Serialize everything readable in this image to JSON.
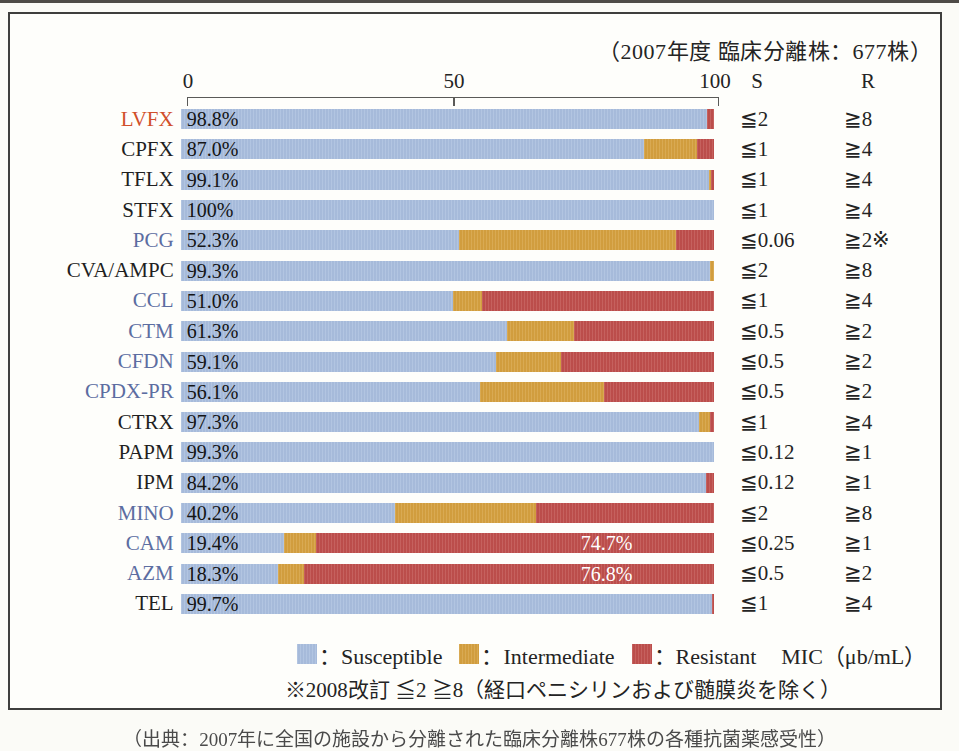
{
  "page": {
    "top_strip_color": "#4e4b47"
  },
  "chart": {
    "title": "（2007年度 臨床分離株：677株）",
    "axis": {
      "ticks": [
        "0",
        "50",
        "100"
      ],
      "col_s_header": "S",
      "col_r_header": "R"
    },
    "rows": [
      {
        "name": "LVFX",
        "name_color": "red",
        "pct_label": "98.8%",
        "s": 98.8,
        "i": 0,
        "r": 1.2,
        "s_mic": "≦2",
        "r_mic": "≧8"
      },
      {
        "name": "CPFX",
        "name_color": "black",
        "pct_label": "87.0%",
        "s": 87.0,
        "i": 9.8,
        "r": 3.2,
        "s_mic": "≦1",
        "r_mic": "≧4"
      },
      {
        "name": "TFLX",
        "name_color": "black",
        "pct_label": "99.1%",
        "s": 99.1,
        "i": 0.4,
        "r": 0.5,
        "s_mic": "≦1",
        "r_mic": "≧4"
      },
      {
        "name": "STFX",
        "name_color": "black",
        "pct_label": "100%",
        "s": 100,
        "i": 0,
        "r": 0,
        "s_mic": "≦1",
        "r_mic": "≧4"
      },
      {
        "name": "PCG",
        "name_color": "blue",
        "pct_label": "52.3%",
        "s": 52.3,
        "i": 40.7,
        "r": 7.0,
        "s_mic": "≦0.06",
        "r_mic": "≧2※"
      },
      {
        "name": "CVA/AMPC",
        "name_color": "black",
        "pct_label": "99.3%",
        "s": 99.3,
        "i": 0.7,
        "r": 0,
        "s_mic": "≦2",
        "r_mic": "≧8"
      },
      {
        "name": "CCL",
        "name_color": "blue",
        "pct_label": "51.0%",
        "s": 51.0,
        "i": 5.5,
        "r": 43.5,
        "s_mic": "≦1",
        "r_mic": "≧4"
      },
      {
        "name": "CTM",
        "name_color": "blue",
        "pct_label": "61.3%",
        "s": 61.3,
        "i": 12.4,
        "r": 26.3,
        "s_mic": "≦0.5",
        "r_mic": "≧2"
      },
      {
        "name": "CFDN",
        "name_color": "blue",
        "pct_label": "59.1%",
        "s": 59.1,
        "i": 12.2,
        "r": 28.7,
        "s_mic": "≦0.5",
        "r_mic": "≧2"
      },
      {
        "name": "CPDX-PR",
        "name_color": "blue",
        "pct_label": "56.1%",
        "s": 56.1,
        "i": 23.3,
        "r": 20.6,
        "s_mic": "≦0.5",
        "r_mic": "≧2"
      },
      {
        "name": "CTRX",
        "name_color": "black",
        "pct_label": "97.3%",
        "s": 97.3,
        "i": 2.0,
        "r": 0.7,
        "s_mic": "≦1",
        "r_mic": "≧4"
      },
      {
        "name": "PAPM",
        "name_color": "black",
        "pct_label": "99.3%",
        "s": 100,
        "i": 0,
        "r": 0,
        "s_mic": "≦0.12",
        "r_mic": "≧1"
      },
      {
        "name": "IPM",
        "name_color": "black",
        "pct_label": "84.2%",
        "s": 98.5,
        "i": 0,
        "r": 1.5,
        "s_mic": "≦0.12",
        "r_mic": "≧1"
      },
      {
        "name": "MINO",
        "name_color": "blue",
        "pct_label": "40.2%",
        "s": 40.2,
        "i": 26.4,
        "r": 33.4,
        "s_mic": "≦2",
        "r_mic": "≧8"
      },
      {
        "name": "CAM",
        "name_color": "blue",
        "pct_label": "19.4%",
        "s": 19.4,
        "i": 5.9,
        "r": 74.7,
        "inner_label": "74.7%",
        "s_mic": "≦0.25",
        "r_mic": "≧1"
      },
      {
        "name": "AZM",
        "name_color": "blue",
        "pct_label": "18.3%",
        "s": 18.3,
        "i": 4.9,
        "r": 76.8,
        "inner_label": "76.8%",
        "s_mic": "≦0.5",
        "r_mic": "≧2"
      },
      {
        "name": "TEL",
        "name_color": "black",
        "pct_label": "99.7%",
        "s": 99.7,
        "i": 0,
        "r": 0.3,
        "s_mic": "≦1",
        "r_mic": "≧4"
      }
    ],
    "legend": [
      {
        "label": "：Susceptible",
        "color": "#a9bede"
      },
      {
        "label": "：Intermediate",
        "color": "#d5a03f"
      },
      {
        "label": "：Resistant",
        "color": "#bf4f4c"
      }
    ],
    "mic_unit_label": "MIC（μb/mL）",
    "footnote": "※2008改訂 ≦2 ≧8（経口ペニシリンおよび髄膜炎を除く）"
  },
  "partial_caption": "（出典：2007年に全国の施設から分離された臨床分離株677株の各種抗菌薬感受性）",
  "colors": {
    "susceptible": "#a9bede",
    "intermediate": "#d5a03f",
    "resistant": "#bf4f4c",
    "label_blue": "#5c6da1",
    "label_red": "#d14f2a"
  },
  "chart_data": {
    "type": "bar",
    "orientation": "horizontal-stacked",
    "title": "（2007年度 臨床分離株：677株）",
    "x_range": [
      0,
      100
    ],
    "x_ticks": [
      0,
      50,
      100
    ],
    "categories": [
      "LVFX",
      "CPFX",
      "TFLX",
      "STFX",
      "PCG",
      "CVA/AMPC",
      "CCL",
      "CTM",
      "CFDN",
      "CPDX-PR",
      "CTRX",
      "PAPM",
      "IPM",
      "MINO",
      "CAM",
      "AZM",
      "TEL"
    ],
    "series": [
      {
        "name": "Susceptible",
        "values": [
          98.8,
          87.0,
          99.1,
          100,
          52.3,
          99.3,
          51.0,
          61.3,
          59.1,
          56.1,
          97.3,
          99.3,
          84.2,
          40.2,
          19.4,
          18.3,
          99.7
        ]
      },
      {
        "name": "Intermediate",
        "values": [
          0,
          9.8,
          0.4,
          0,
          40.7,
          0.7,
          5.5,
          12.4,
          12.2,
          23.3,
          2.0,
          0,
          0,
          26.4,
          5.9,
          4.9,
          0
        ]
      },
      {
        "name": "Resistant",
        "values": [
          1.2,
          3.2,
          0.5,
          0,
          7.0,
          0,
          43.5,
          26.3,
          28.7,
          20.6,
          0.7,
          0.7,
          1.5,
          33.4,
          74.7,
          76.8,
          0.3
        ]
      }
    ],
    "data_labels": {
      "CAM_resistant": "74.7%",
      "AZM_resistant": "76.8%"
    },
    "mic_breakpoints": {
      "LVFX": {
        "S": "≦2",
        "R": "≧8"
      },
      "CPFX": {
        "S": "≦1",
        "R": "≧4"
      },
      "TFLX": {
        "S": "≦1",
        "R": "≧4"
      },
      "STFX": {
        "S": "≦1",
        "R": "≧4"
      },
      "PCG": {
        "S": "≦0.06",
        "R": "≧2※"
      },
      "CVA/AMPC": {
        "S": "≦2",
        "R": "≧8"
      },
      "CCL": {
        "S": "≦1",
        "R": "≧4"
      },
      "CTM": {
        "S": "≦0.5",
        "R": "≧2"
      },
      "CFDN": {
        "S": "≦0.5",
        "R": "≧2"
      },
      "CPDX-PR": {
        "S": "≦0.5",
        "R": "≧2"
      },
      "CTRX": {
        "S": "≦1",
        "R": "≧4"
      },
      "PAPM": {
        "S": "≦0.12",
        "R": "≧1"
      },
      "IPM": {
        "S": "≦0.12",
        "R": "≧1"
      },
      "MINO": {
        "S": "≦2",
        "R": "≧8"
      },
      "CAM": {
        "S": "≦0.25",
        "R": "≧1"
      },
      "AZM": {
        "S": "≦0.5",
        "R": "≧2"
      },
      "TEL": {
        "S": "≦1",
        "R": "≧4"
      }
    },
    "legend_entries": [
      "：Susceptible",
      "：Intermediate",
      "：Resistant",
      "MIC（μb/mL）"
    ],
    "legend_position": "bottom",
    "grid": false,
    "footnote": "※2008改訂 ≦2 ≧8（経口ペニシリンおよび髄膜炎を除く）"
  }
}
